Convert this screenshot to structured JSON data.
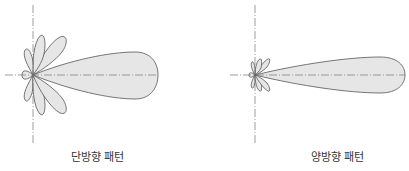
{
  "diagrams": [
    {
      "id": "unidirectional",
      "label": "단방향 패턴"
    },
    {
      "id": "bidirectional",
      "label": "양방향 패턴"
    }
  ],
  "colors": {
    "lobe_fill": "#e6e6e6",
    "lobe_stroke": "#555555",
    "axis": "#777777"
  },
  "caption": "그림 ... 안테나의 방사 패턴"
}
